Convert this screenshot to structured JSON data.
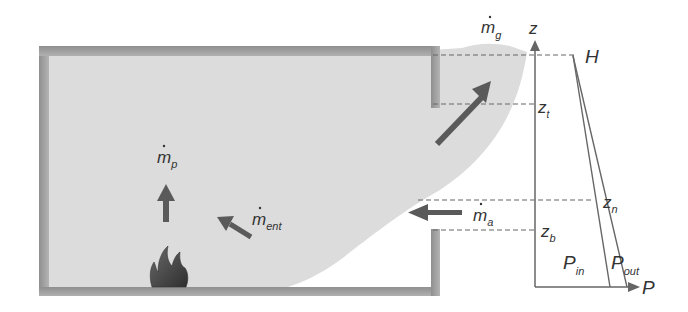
{
  "diagram": {
    "colors": {
      "wall": "#9a9a9a",
      "smoke": "#dcdcdc",
      "arrow": "#5a5a5a",
      "line": "#666666",
      "text": "#333333",
      "flame": "#4a4a4a"
    },
    "flow_labels": {
      "m_g": {
        "base": "m",
        "sub": "g"
      },
      "m_p": {
        "base": "m",
        "sub": "p"
      },
      "m_ent": {
        "base": "m",
        "sub": "ent"
      },
      "m_a": {
        "base": "m",
        "sub": "a"
      }
    },
    "axis": {
      "z_label": "z",
      "p_label": "P"
    },
    "heights": {
      "H": "H",
      "z_t": {
        "base": "z",
        "sub": "t"
      },
      "z_n": {
        "base": "z",
        "sub": "n"
      },
      "z_b": {
        "base": "z",
        "sub": "b"
      }
    },
    "pressure_curves": {
      "P_in": {
        "base": "P",
        "sub": "in"
      },
      "P_out": {
        "base": "P",
        "sub": "out"
      }
    }
  }
}
